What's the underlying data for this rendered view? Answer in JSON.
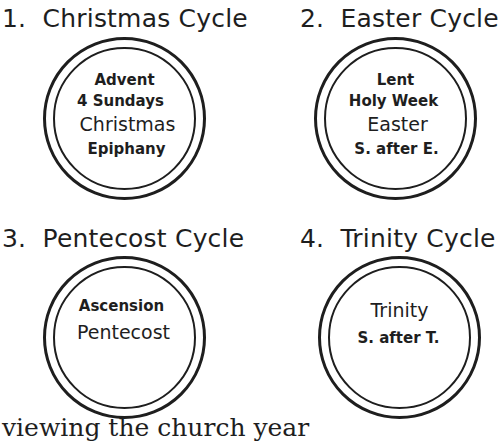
{
  "diagram": {
    "cycles": [
      {
        "number": "1.",
        "title": "Christmas Cycle",
        "items": [
          "Advent",
          "4 Sundays",
          "Christmas",
          "Epiphany"
        ]
      },
      {
        "number": "2.",
        "title": "Easter Cycle",
        "items": [
          "Lent",
          "Holy Week",
          "Easter",
          "S. after E."
        ]
      },
      {
        "number": "3.",
        "title": "Pentecost Cycle",
        "items": [
          "Ascension",
          "Pentecost"
        ]
      },
      {
        "number": "4.",
        "title": "Trinity Cycle",
        "items": [
          "Trinity",
          "S. after T."
        ]
      }
    ],
    "footer_text": "viewing the church year"
  }
}
